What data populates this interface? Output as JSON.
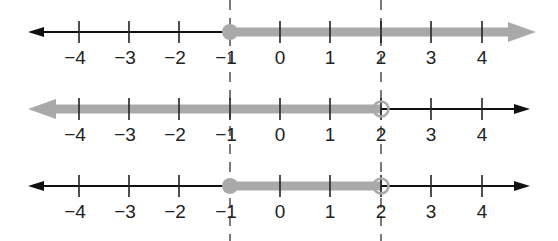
{
  "figure": {
    "tick_labels": [
      "−4",
      "−3",
      "−2",
      "−1",
      "0",
      "1",
      "2",
      "3",
      "4"
    ],
    "tick_values": [
      -4,
      -3,
      -2,
      -1,
      0,
      1,
      2,
      3,
      4
    ],
    "colors": {
      "axis": "#111111",
      "shade": "#a9a9a9",
      "guide": "#777777"
    },
    "guides": [
      {
        "value": -1,
        "style": "dashed"
      },
      {
        "value": 2,
        "style": "dashed"
      }
    ],
    "lines": [
      {
        "name": "line-1",
        "shade_from": -1,
        "shade_to": "+inf",
        "left_endpoint": "closed",
        "right_endpoint": "arrow",
        "inequality": "x ≥ −1"
      },
      {
        "name": "line-2",
        "shade_from": "-inf",
        "shade_to": 2,
        "left_endpoint": "arrow",
        "right_endpoint": "open",
        "inequality": "x < 2"
      },
      {
        "name": "line-3",
        "shade_from": -1,
        "shade_to": 2,
        "left_endpoint": "closed",
        "right_endpoint": "open",
        "inequality": "−1 ≤ x < 2"
      }
    ]
  }
}
